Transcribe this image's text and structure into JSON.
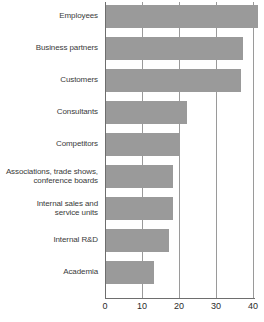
{
  "chart_data": {
    "type": "bar",
    "orientation": "horizontal",
    "title": "",
    "subtitle": "",
    "xlabel": "",
    "ylabel": "",
    "xlim": [
      0,
      41.5
    ],
    "xticks": [
      0,
      10,
      20,
      30,
      40
    ],
    "xtick_labels": [
      "0",
      "10",
      "20",
      "30",
      "40"
    ],
    "grid": true,
    "grid_axis": "x",
    "legend": false,
    "legend_position": "none",
    "bar_color": "#9a9a9a",
    "axis_color": "#6e6e6e",
    "label_color": "#3a3a3a",
    "background": "#ffffff",
    "categories": [
      "Employees",
      "Business partners",
      "Customers",
      "Consultants",
      "Competitors",
      "Associations, trade shows,\nconference boards",
      "Internal sales and\nservice units",
      "Internal R&D",
      "Academia"
    ],
    "values": [
      41,
      37,
      36.5,
      22,
      20,
      18,
      18,
      17,
      13
    ]
  }
}
